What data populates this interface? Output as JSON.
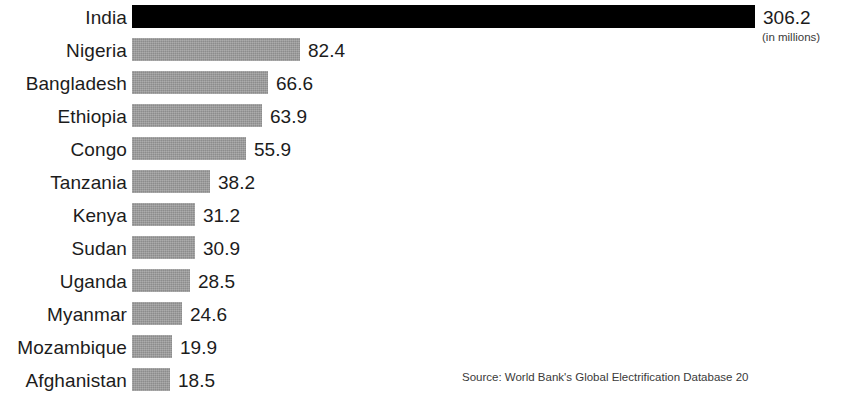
{
  "chart_data": {
    "type": "bar",
    "orientation": "horizontal",
    "title": "",
    "subtitle": "",
    "xlabel": "",
    "ylabel": "",
    "units_note": "(in millions)",
    "source": "Source: World Bank's Global Electrification Database 20",
    "grid": false,
    "legend": null,
    "xlim": [
      0,
      306.2
    ],
    "categories": [
      "India",
      "Nigeria",
      "Bangladesh",
      "Ethiopia",
      "Congo",
      "Tanzania",
      "Kenya",
      "Sudan",
      "Uganda",
      "Myanmar",
      "Mozambique",
      "Afghanistan"
    ],
    "values": [
      306.2,
      82.4,
      66.6,
      63.9,
      55.9,
      38.2,
      31.2,
      30.9,
      28.5,
      24.6,
      19.9,
      18.5
    ],
    "value_labels": [
      "306.2",
      "82.4",
      "66.6",
      "63.9",
      "55.9",
      "38.2",
      "31.2",
      "30.9",
      "28.5",
      "24.6",
      "19.9",
      "18.5"
    ],
    "highlight_index": 0,
    "colors": {
      "bar": "#9b9b9b",
      "bar_highlight": "#000000",
      "text": "#1c1c1c",
      "note_text": "#3a3a3a",
      "background": "#ffffff"
    }
  },
  "layout": {
    "bar_origin_x": 132,
    "px_per_unit": 2.035,
    "row_top_start": 5,
    "row_pitch": 33,
    "bar_height": 23,
    "value_gap": 8
  }
}
